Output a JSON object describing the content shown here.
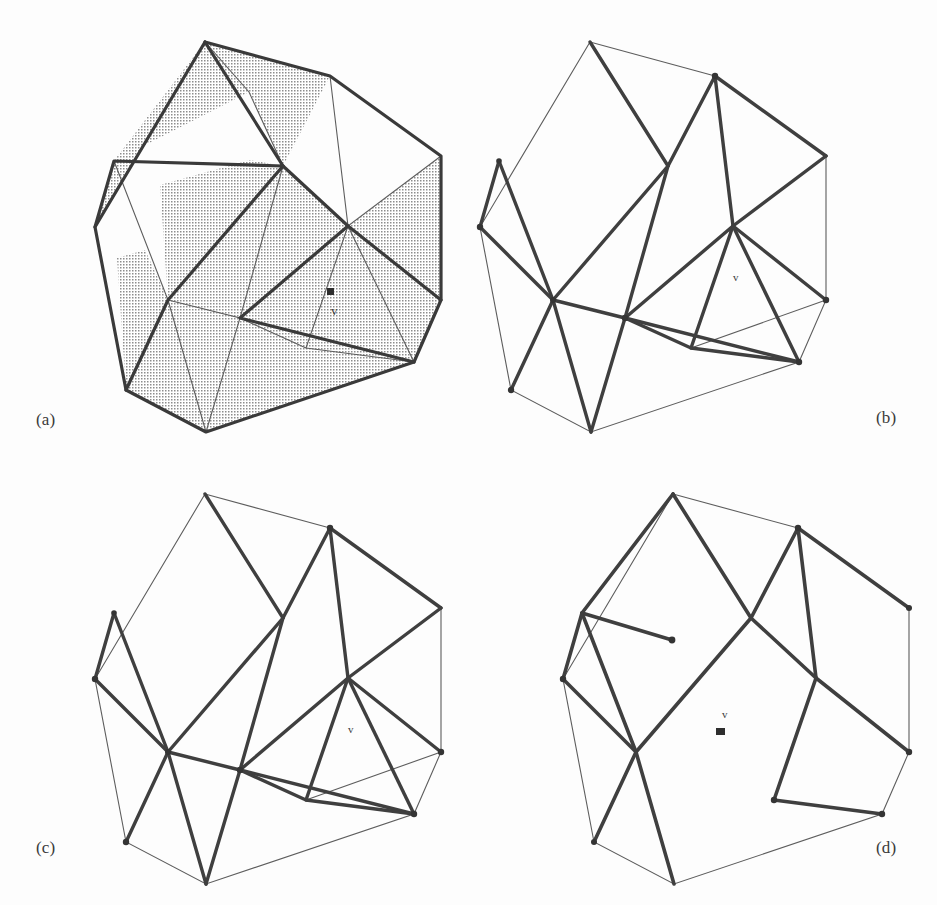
{
  "figure": {
    "background_color": "#fdfdfd",
    "ink_color": "#3a3a3a",
    "thin_color": "#5a5a5a",
    "shade_color": "#9a9a9a",
    "width": 937,
    "height": 905
  },
  "panels": {
    "a": {
      "label": "(a)",
      "vertex_label": "v",
      "caption_role": "triangulated polygon with shaded region",
      "outline": "205,42 330,76 441,156 441,300 414,362 206,432 126,390 95,227",
      "thick_edges": [
        "205,42 330,76",
        "330,76 441,156",
        "441,156 441,300",
        "441,300 414,362",
        "414,362 206,432",
        "206,432 126,390",
        "126,390 95,227",
        "95,227 205,42",
        "205,42 283,166",
        "283,166 114,161",
        "114,161 95,227",
        "283,166 168,300",
        "168,300 126,390",
        "283,166 348,226",
        "348,226 240,318",
        "240,318 414,362",
        "348,226 441,300"
      ],
      "thin_edges": [
        "205,42 249,92",
        "249,92 283,166",
        "330,76 348,226",
        "348,226 441,156",
        "348,226 306,348",
        "306,348 240,318",
        "348,226 414,362",
        "114,161 168,300",
        "168,300 206,432",
        "168,300 240,318",
        "240,318 206,432",
        "306,348 414,362",
        "283,166 240,318"
      ],
      "shaded_faces": [
        "205,42 249,92 114,161",
        "205,42 249,92 283,166 330,76",
        "95,227 114,161 205,42",
        "283,166 348,226 306,348 240,318",
        "348,226 441,156 441,300",
        "348,226 441,300 414,362 306,348",
        "114,161 168,300 283,166",
        "168,300 283,166 240,318",
        "126,390 168,300 95,227 114,161",
        "126,390 168,300 206,432",
        "168,300 240,318 206,432",
        "240,318 414,362 206,432"
      ],
      "marker": {
        "x": 330,
        "y": 294,
        "label_x": 331,
        "label_y": 315
      }
    },
    "b": {
      "label": "(b)",
      "vertex_label": "v",
      "caption_role": "first decomposition step",
      "outline": "590,42 715,76 826,156 826,300 799,362 591,432 511,390 480,227",
      "thick_edges": [
        "590,42 668,166",
        "668,166 715,76",
        "715,76 733,226",
        "733,226 826,156",
        "733,226 691,348",
        "691,348 625,318",
        "625,318 733,226",
        "733,226 799,362",
        "668,166 553,300",
        "553,300 511,390",
        "499,161 553,300",
        "553,300 625,318",
        "480,227 553,300",
        "553,300 591,432",
        "499,161 480,227",
        "625,318 591,432",
        "691,348 799,362",
        "625,318 799,362",
        "668,166 625,318",
        "733,226 826,300",
        "715,76 826,156"
      ],
      "thin_edges": [
        "590,42 715,76",
        "826,156 826,300",
        "826,300 799,362",
        "799,362 591,432",
        "591,432 511,390",
        "511,390 480,227",
        "480,227 590,42",
        "691,348 826,300"
      ],
      "dots": [
        "715,76",
        "480,227",
        "826,300",
        "799,362",
        "511,390",
        "625,318",
        "553,300",
        "499,161"
      ],
      "marker": {
        "label_x": 733,
        "label_y": 281
      }
    },
    "c": {
      "label": "(c)",
      "vertex_label": "v",
      "caption_role": "second decomposition step",
      "outline": "205,494 330,528 441,608 441,752 414,814 206,884 126,842 95,679",
      "thick_edges": [
        "205,494 283,618",
        "283,618 330,528",
        "330,528 348,678",
        "348,678 441,608",
        "348,678 306,800",
        "306,800 240,770",
        "240,770 348,678",
        "348,678 414,814",
        "283,618 168,752",
        "168,752 126,842",
        "114,613 168,752",
        "168,752 240,770",
        "95,679 168,752",
        "168,752 206,884",
        "114,613 95,679",
        "240,770 206,884",
        "306,800 414,814",
        "240,770 414,814",
        "283,618 240,770",
        "348,678 441,752",
        "330,528 441,608"
      ],
      "thin_edges": [
        "205,494 330,528",
        "441,608 441,752",
        "441,752 414,814",
        "414,814 206,884",
        "206,884 126,842",
        "126,842 95,679",
        "95,679 205,494",
        "306,800 441,752"
      ],
      "dots": [
        "330,528",
        "95,679",
        "441,752",
        "414,814",
        "126,842",
        "240,770",
        "168,752",
        "114,613"
      ],
      "marker": {
        "label_x": 348,
        "label_y": 733
      }
    },
    "d": {
      "label": "(d)",
      "vertex_label": "v",
      "caption_role": "final convex decomposition",
      "outline": "673,494 798,528 909,608 909,752 882,814 674,884 594,842 563,679",
      "thick_edges": [
        "673,494 751,618",
        "751,618 798,528",
        "798,528 816,678",
        "816,678 774,800",
        "774,800 882,814",
        "816,678 909,752",
        "751,618 636,752",
        "636,752 594,842",
        "582,613 636,752",
        "563,679 636,752",
        "636,752 674,884",
        "582,613 563,679",
        "798,528 909,608",
        "636,752 751,618",
        "582,613 672,640"
      ],
      "thick_edges_extra": [
        "673,494 582,613",
        "582,613 672,640",
        "751,618 816,678",
        "774,800 674,884"
      ],
      "thin_edges": [
        "673,494 798,528",
        "909,608 909,752",
        "909,752 882,814",
        "882,814 674,884",
        "674,884 594,842",
        "594,842 563,679",
        "563,679 673,494"
      ],
      "dots": [
        "798,528",
        "563,679",
        "909,752",
        "882,814",
        "594,842",
        "672,640",
        "774,800",
        "909,608"
      ],
      "marker": {
        "x": 720,
        "y": 733,
        "label_x": 722,
        "label_y": 718
      }
    }
  }
}
